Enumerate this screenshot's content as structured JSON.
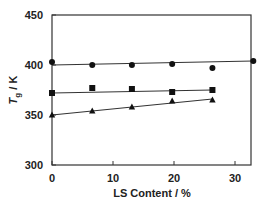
{
  "chart_data": {
    "type": "scatter",
    "title": "",
    "xlabel": "LS Content / %",
    "ylabel": "Tg / K",
    "ylabel_main": "T",
    "ylabel_sub": "g",
    "ylabel_unit": " / K",
    "xlim": [
      0,
      33
    ],
    "ylim": [
      300,
      450
    ],
    "xticks": [
      0,
      10,
      20,
      30
    ],
    "yticks": [
      300,
      350,
      400,
      450
    ],
    "grid": false,
    "legend": null,
    "series": [
      {
        "name": "circles",
        "marker": "circle",
        "x": [
          0,
          6.6,
          13.1,
          19.7,
          26.3,
          33
        ],
        "y": [
          403,
          400,
          400,
          401,
          397,
          404
        ],
        "fit_line": {
          "x": [
            0,
            33
          ],
          "y": [
            400,
            404
          ]
        }
      },
      {
        "name": "squares",
        "marker": "square",
        "x": [
          0,
          6.6,
          13.1,
          19.7,
          26.3
        ],
        "y": [
          372,
          377,
          376,
          373,
          375
        ],
        "fit_line": {
          "x": [
            0,
            26.3
          ],
          "y": [
            372,
            375
          ]
        }
      },
      {
        "name": "triangles",
        "marker": "triangle",
        "x": [
          0,
          6.6,
          13.1,
          19.7,
          26.3
        ],
        "y": [
          350,
          354,
          358,
          364,
          365
        ],
        "fit_line": {
          "x": [
            0,
            26.3
          ],
          "y": [
            350,
            366
          ]
        }
      }
    ],
    "colors": {
      "axis": "#333333",
      "marker": "#111111",
      "line": "#333333"
    }
  }
}
